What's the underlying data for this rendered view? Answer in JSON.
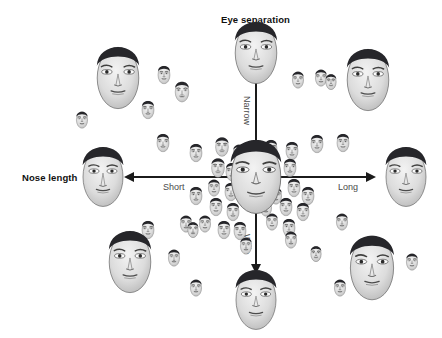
{
  "figure": {
    "type": "scatter",
    "background_color": "#ffffff",
    "axis_color": "#1b1b1b",
    "title_color": "#111111",
    "pole_label_color": "#4a4a4a"
  },
  "axes": {
    "vertical": {
      "title": "Eye separation",
      "title_pos": {
        "x": 221,
        "y": 14
      },
      "line": {
        "x": 256,
        "y_top": 74,
        "y_bottom": 272
      },
      "positive_pole_label": "Narrow",
      "positive_pole_pos": {
        "x": 249,
        "y": 96
      },
      "negative_pole_label": "Wide",
      "negative_pole_pos": {
        "x": 249,
        "y": 234
      }
    },
    "horizontal": {
      "title": "Nose length",
      "title_pos": {
        "x": 22,
        "y": 172
      },
      "line": {
        "y": 177,
        "x_left": 128,
        "x_right": 372
      },
      "negative_pole_label": "Short",
      "negative_pole_pos": {
        "x": 163,
        "y": 182
      },
      "positive_pole_label": "Long",
      "positive_pole_pos": {
        "x": 338,
        "y": 182
      }
    }
  },
  "chart_data": {
    "type": "scatter",
    "xlabel": "Nose length",
    "ylabel": "Eye separation",
    "x_tick_labels": [
      "Short",
      "Long"
    ],
    "y_tick_labels": [
      "Narrow",
      "Wide"
    ],
    "grid": false,
    "legend": "none",
    "axis_origin": {
      "x": 256,
      "y": 177
    },
    "note": "Grayscale face exemplars positioned in a two-dimensional face space; size encodes distance from the central prototype.",
    "points": [
      {
        "name": "prototype-center",
        "x": 256,
        "y": 177,
        "size": 62,
        "role": "prototype"
      },
      {
        "name": "axis-extreme-narrow",
        "x": 256,
        "y": 53,
        "size": 52,
        "role": "axis-extreme"
      },
      {
        "name": "axis-extreme-wide",
        "x": 256,
        "y": 300,
        "size": 50,
        "role": "axis-extreme"
      },
      {
        "name": "axis-extreme-short",
        "x": 103,
        "y": 177,
        "size": 50,
        "role": "axis-extreme"
      },
      {
        "name": "axis-extreme-long",
        "x": 406,
        "y": 177,
        "size": 50,
        "role": "axis-extreme"
      },
      {
        "name": "quadrant-upper-left",
        "x": 118,
        "y": 78,
        "size": 52,
        "role": "quadrant-extreme"
      },
      {
        "name": "quadrant-upper-right",
        "x": 368,
        "y": 80,
        "size": 52,
        "role": "quadrant-extreme"
      },
      {
        "name": "quadrant-lower-left",
        "x": 130,
        "y": 262,
        "size": 52,
        "role": "quadrant-extreme"
      },
      {
        "name": "quadrant-lower-right",
        "x": 372,
        "y": 268,
        "size": 54,
        "role": "quadrant-extreme"
      },
      {
        "name": "exemplar-01",
        "x": 164,
        "y": 75,
        "size": 15,
        "role": "exemplar"
      },
      {
        "name": "exemplar-02",
        "x": 182,
        "y": 92,
        "size": 17,
        "role": "exemplar"
      },
      {
        "name": "exemplar-03",
        "x": 148,
        "y": 110,
        "size": 15,
        "role": "exemplar"
      },
      {
        "name": "exemplar-04",
        "x": 82,
        "y": 120,
        "size": 14,
        "role": "exemplar"
      },
      {
        "name": "exemplar-05",
        "x": 163,
        "y": 143,
        "size": 15,
        "role": "exemplar"
      },
      {
        "name": "exemplar-06",
        "x": 196,
        "y": 153,
        "size": 15,
        "role": "exemplar"
      },
      {
        "name": "exemplar-07",
        "x": 222,
        "y": 147,
        "size": 16,
        "role": "exemplar"
      },
      {
        "name": "exemplar-08",
        "x": 239,
        "y": 153,
        "size": 14,
        "role": "exemplar"
      },
      {
        "name": "exemplar-09",
        "x": 253,
        "y": 155,
        "size": 13,
        "role": "exemplar"
      },
      {
        "name": "exemplar-10",
        "x": 271,
        "y": 149,
        "size": 15,
        "role": "exemplar"
      },
      {
        "name": "exemplar-11",
        "x": 292,
        "y": 151,
        "size": 15,
        "role": "exemplar"
      },
      {
        "name": "exemplar-12",
        "x": 317,
        "y": 144,
        "size": 15,
        "role": "exemplar"
      },
      {
        "name": "exemplar-13",
        "x": 343,
        "y": 143,
        "size": 15,
        "role": "exemplar"
      },
      {
        "name": "exemplar-14",
        "x": 298,
        "y": 80,
        "size": 14,
        "role": "exemplar"
      },
      {
        "name": "exemplar-15",
        "x": 321,
        "y": 78,
        "size": 14,
        "role": "exemplar"
      },
      {
        "name": "exemplar-16",
        "x": 218,
        "y": 168,
        "size": 16,
        "role": "exemplar"
      },
      {
        "name": "exemplar-17",
        "x": 232,
        "y": 172,
        "size": 15,
        "role": "exemplar"
      },
      {
        "name": "exemplar-18",
        "x": 214,
        "y": 188,
        "size": 14,
        "role": "exemplar"
      },
      {
        "name": "exemplar-19",
        "x": 231,
        "y": 192,
        "size": 15,
        "role": "exemplar"
      },
      {
        "name": "exemplar-20",
        "x": 196,
        "y": 196,
        "size": 15,
        "role": "exemplar"
      },
      {
        "name": "exemplar-21",
        "x": 216,
        "y": 207,
        "size": 15,
        "role": "exemplar"
      },
      {
        "name": "exemplar-22",
        "x": 233,
        "y": 212,
        "size": 15,
        "role": "exemplar"
      },
      {
        "name": "exemplar-23",
        "x": 205,
        "y": 224,
        "size": 14,
        "role": "exemplar"
      },
      {
        "name": "exemplar-24",
        "x": 224,
        "y": 230,
        "size": 15,
        "role": "exemplar"
      },
      {
        "name": "exemplar-25",
        "x": 240,
        "y": 231,
        "size": 15,
        "role": "exemplar"
      },
      {
        "name": "exemplar-26",
        "x": 246,
        "y": 246,
        "size": 14,
        "role": "exemplar"
      },
      {
        "name": "exemplar-27",
        "x": 186,
        "y": 224,
        "size": 14,
        "role": "exemplar"
      },
      {
        "name": "exemplar-28",
        "x": 290,
        "y": 168,
        "size": 15,
        "role": "exemplar"
      },
      {
        "name": "exemplar-29",
        "x": 294,
        "y": 188,
        "size": 15,
        "role": "exemplar"
      },
      {
        "name": "exemplar-30",
        "x": 308,
        "y": 196,
        "size": 15,
        "role": "exemplar"
      },
      {
        "name": "exemplar-31",
        "x": 286,
        "y": 207,
        "size": 15,
        "role": "exemplar"
      },
      {
        "name": "exemplar-32",
        "x": 303,
        "y": 212,
        "size": 15,
        "role": "exemplar"
      },
      {
        "name": "exemplar-33",
        "x": 272,
        "y": 222,
        "size": 14,
        "role": "exemplar"
      },
      {
        "name": "exemplar-34",
        "x": 289,
        "y": 228,
        "size": 15,
        "role": "exemplar"
      },
      {
        "name": "exemplar-35",
        "x": 276,
        "y": 196,
        "size": 14,
        "role": "exemplar"
      },
      {
        "name": "exemplar-36",
        "x": 193,
        "y": 230,
        "size": 13,
        "role": "exemplar"
      },
      {
        "name": "exemplar-37",
        "x": 148,
        "y": 230,
        "size": 15,
        "role": "exemplar"
      },
      {
        "name": "exemplar-38",
        "x": 174,
        "y": 258,
        "size": 14,
        "role": "exemplar"
      },
      {
        "name": "exemplar-39",
        "x": 196,
        "y": 288,
        "size": 14,
        "role": "exemplar"
      },
      {
        "name": "exemplar-40",
        "x": 291,
        "y": 240,
        "size": 14,
        "role": "exemplar"
      },
      {
        "name": "exemplar-41",
        "x": 342,
        "y": 222,
        "size": 14,
        "role": "exemplar"
      },
      {
        "name": "exemplar-42",
        "x": 316,
        "y": 254,
        "size": 13,
        "role": "exemplar"
      },
      {
        "name": "exemplar-43",
        "x": 340,
        "y": 288,
        "size": 14,
        "role": "exemplar"
      },
      {
        "name": "exemplar-44",
        "x": 412,
        "y": 262,
        "size": 14,
        "role": "exemplar"
      },
      {
        "name": "exemplar-45",
        "x": 331,
        "y": 82,
        "size": 13,
        "role": "exemplar"
      },
      {
        "name": "exemplar-46",
        "x": 258,
        "y": 173,
        "size": 14,
        "role": "exemplar"
      },
      {
        "name": "exemplar-47",
        "x": 266,
        "y": 208,
        "size": 14,
        "role": "exemplar"
      },
      {
        "name": "exemplar-48",
        "x": 251,
        "y": 200,
        "size": 13,
        "role": "exemplar"
      }
    ]
  }
}
